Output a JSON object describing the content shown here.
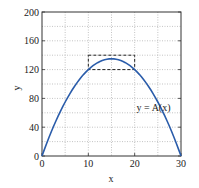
{
  "chart_data": {
    "type": "line",
    "title": "",
    "xlabel": "x",
    "ylabel": "y",
    "xlim": [
      0,
      30
    ],
    "ylim": [
      0,
      200
    ],
    "xticks": [
      0,
      10,
      20,
      30
    ],
    "yticks": [
      0,
      40,
      80,
      120,
      160,
      200
    ],
    "x_minor_grid": [
      5,
      15,
      25
    ],
    "y_minor_grid": [
      20,
      60,
      100,
      140,
      180
    ],
    "grid": true,
    "series": [
      {
        "name": "y = A(x)",
        "color": "#2a5caa",
        "x": [
          0,
          2,
          4,
          6,
          8,
          10,
          12,
          14,
          15,
          16,
          18,
          20,
          22,
          24,
          26,
          28,
          30
        ],
        "values": [
          0,
          33.6,
          62.4,
          86.4,
          105.6,
          120,
          129.6,
          134.4,
          135,
          134.4,
          129.6,
          120,
          105.6,
          86.4,
          62.4,
          33.6,
          0
        ]
      }
    ],
    "annotations": [
      {
        "type": "text",
        "text": "y = A(x)",
        "x": 23,
        "y": 68
      },
      {
        "type": "dashed-rectangle",
        "x0": 10,
        "x1": 20,
        "y0": 120,
        "y1": 140
      }
    ]
  }
}
